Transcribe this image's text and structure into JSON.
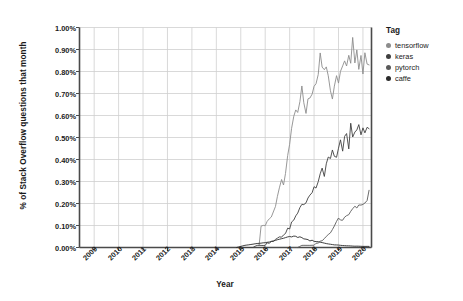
{
  "chart_data": {
    "type": "line",
    "title": "",
    "xlabel": "Year",
    "ylabel": "% of Stack Overflow questions that month",
    "xlim": [
      2008.4,
      2020.35
    ],
    "ylim": [
      0.0,
      1.0
    ],
    "grid": true,
    "legend_position": "right",
    "legend_title": "Tag",
    "xticks": [
      "2009",
      "2010",
      "2011",
      "2012",
      "2013",
      "2014",
      "2015",
      "2016",
      "2017",
      "2018",
      "2019",
      "2020"
    ],
    "xtick_values": [
      2009,
      2010,
      2011,
      2012,
      2013,
      2014,
      2015,
      2016,
      2017,
      2018,
      2019,
      2020
    ],
    "yticks": [
      "0.00%",
      "0.10%",
      "0.20%",
      "0.30%",
      "0.40%",
      "0.50%",
      "0.60%",
      "0.70%",
      "0.80%",
      "0.90%",
      "1.00%"
    ],
    "ytick_values": [
      0.0,
      0.1,
      0.2,
      0.3,
      0.4,
      0.5,
      0.6,
      0.7,
      0.8,
      0.9,
      1.0
    ],
    "series": [
      {
        "name": "tensorflow",
        "color": "#8c8c8c",
        "x": [
          2015.75,
          2015.83,
          2015.92,
          2016.0,
          2016.08,
          2016.17,
          2016.25,
          2016.33,
          2016.42,
          2016.5,
          2016.58,
          2016.67,
          2016.75,
          2016.83,
          2016.92,
          2017.0,
          2017.08,
          2017.17,
          2017.25,
          2017.33,
          2017.42,
          2017.5,
          2017.58,
          2017.67,
          2017.75,
          2017.83,
          2017.92,
          2018.0,
          2018.08,
          2018.17,
          2018.25,
          2018.33,
          2018.42,
          2018.5,
          2018.58,
          2018.67,
          2018.75,
          2018.83,
          2018.92,
          2019.0,
          2019.08,
          2019.17,
          2019.25,
          2019.33,
          2019.42,
          2019.5,
          2019.58,
          2019.67,
          2019.75,
          2019.83,
          2019.92,
          2020.0,
          2020.08,
          2020.17,
          2020.25
        ],
        "y": [
          0.01,
          0.09,
          0.1,
          0.11,
          0.12,
          0.13,
          0.15,
          0.17,
          0.19,
          0.22,
          0.26,
          0.3,
          0.31,
          0.36,
          0.41,
          0.47,
          0.53,
          0.58,
          0.62,
          0.63,
          0.66,
          0.72,
          0.64,
          0.62,
          0.68,
          0.7,
          0.7,
          0.71,
          0.75,
          0.79,
          0.87,
          0.84,
          0.8,
          0.83,
          0.77,
          0.71,
          0.7,
          0.73,
          0.78,
          0.76,
          0.82,
          0.8,
          0.85,
          0.81,
          0.88,
          0.86,
          0.93,
          0.86,
          0.9,
          0.83,
          0.87,
          0.81,
          0.88,
          0.85,
          0.83
        ]
      },
      {
        "name": "keras",
        "color": "#3f3f3f",
        "x": [
          2015.0,
          2015.17,
          2015.33,
          2015.5,
          2015.67,
          2015.83,
          2016.0,
          2016.08,
          2016.17,
          2016.25,
          2016.33,
          2016.42,
          2016.5,
          2016.58,
          2016.67,
          2016.75,
          2016.83,
          2016.92,
          2017.0,
          2017.08,
          2017.17,
          2017.25,
          2017.33,
          2017.42,
          2017.5,
          2017.58,
          2017.67,
          2017.75,
          2017.83,
          2017.92,
          2018.0,
          2018.08,
          2018.17,
          2018.25,
          2018.33,
          2018.42,
          2018.5,
          2018.58,
          2018.67,
          2018.75,
          2018.83,
          2018.92,
          2019.0,
          2019.08,
          2019.17,
          2019.25,
          2019.33,
          2019.42,
          2019.5,
          2019.58,
          2019.67,
          2019.75,
          2019.83,
          2019.92,
          2020.0,
          2020.08,
          2020.17,
          2020.25
        ],
        "y": [
          0.0,
          0.0,
          0.0,
          0.0,
          0.01,
          0.01,
          0.01,
          0.02,
          0.02,
          0.03,
          0.03,
          0.04,
          0.04,
          0.05,
          0.05,
          0.06,
          0.07,
          0.08,
          0.09,
          0.11,
          0.12,
          0.13,
          0.15,
          0.17,
          0.18,
          0.2,
          0.19,
          0.22,
          0.25,
          0.26,
          0.28,
          0.27,
          0.31,
          0.33,
          0.35,
          0.33,
          0.37,
          0.41,
          0.39,
          0.45,
          0.43,
          0.41,
          0.45,
          0.48,
          0.44,
          0.49,
          0.53,
          0.46,
          0.55,
          0.5,
          0.54,
          0.52,
          0.56,
          0.51,
          0.55,
          0.53,
          0.56,
          0.54
        ]
      },
      {
        "name": "pytorch",
        "color": "#5a5a5a",
        "x": [
          2017.0,
          2017.17,
          2017.33,
          2017.5,
          2017.67,
          2017.83,
          2018.0,
          2018.08,
          2018.17,
          2018.25,
          2018.33,
          2018.42,
          2018.5,
          2018.58,
          2018.67,
          2018.75,
          2018.83,
          2018.92,
          2019.0,
          2019.08,
          2019.17,
          2019.25,
          2019.33,
          2019.42,
          2019.5,
          2019.58,
          2019.67,
          2019.75,
          2019.83,
          2019.92,
          2020.0,
          2020.08,
          2020.17,
          2020.25
        ],
        "y": [
          0.0,
          0.0,
          0.0,
          0.01,
          0.01,
          0.01,
          0.01,
          0.02,
          0.02,
          0.03,
          0.03,
          0.04,
          0.05,
          0.06,
          0.07,
          0.08,
          0.1,
          0.12,
          0.13,
          0.13,
          0.13,
          0.14,
          0.15,
          0.15,
          0.16,
          0.17,
          0.18,
          0.18,
          0.19,
          0.2,
          0.19,
          0.21,
          0.22,
          0.26
        ]
      },
      {
        "name": "caffe",
        "color": "#2b2b2b",
        "x": [
          2014.83,
          2015.0,
          2015.17,
          2015.33,
          2015.5,
          2015.67,
          2015.83,
          2016.0,
          2016.17,
          2016.33,
          2016.5,
          2016.67,
          2016.83,
          2017.0,
          2017.08,
          2017.17,
          2017.25,
          2017.33,
          2017.42,
          2017.5,
          2017.58,
          2017.67,
          2017.75,
          2017.83,
          2017.92,
          2018.0,
          2018.17,
          2018.33,
          2018.5,
          2018.67,
          2018.83,
          2019.0,
          2019.17,
          2019.33,
          2019.5,
          2019.67,
          2019.83,
          2020.0,
          2020.17,
          2020.25
        ],
        "y": [
          0.0,
          0.005,
          0.01,
          0.012,
          0.015,
          0.018,
          0.02,
          0.022,
          0.025,
          0.03,
          0.035,
          0.04,
          0.045,
          0.05,
          0.048,
          0.052,
          0.05,
          0.046,
          0.048,
          0.044,
          0.04,
          0.038,
          0.035,
          0.03,
          0.033,
          0.028,
          0.026,
          0.022,
          0.018,
          0.015,
          0.012,
          0.011,
          0.009,
          0.008,
          0.007,
          0.006,
          0.006,
          0.005,
          0.005,
          0.005
        ]
      }
    ]
  },
  "legend": {
    "title": "Tag",
    "items": [
      {
        "label": "tensorflow",
        "color": "#8c8c8c"
      },
      {
        "label": "keras",
        "color": "#3f3f3f"
      },
      {
        "label": "pytorch",
        "color": "#5a5a5a"
      },
      {
        "label": "caffe",
        "color": "#2b2b2b"
      }
    ]
  },
  "axes": {
    "ylabel": "% of Stack Overflow questions that month",
    "xlabel": "Year"
  },
  "style": {
    "grid_color": "#cfcfcf",
    "axis_color": "#4a4a4a",
    "background": "#ffffff"
  }
}
